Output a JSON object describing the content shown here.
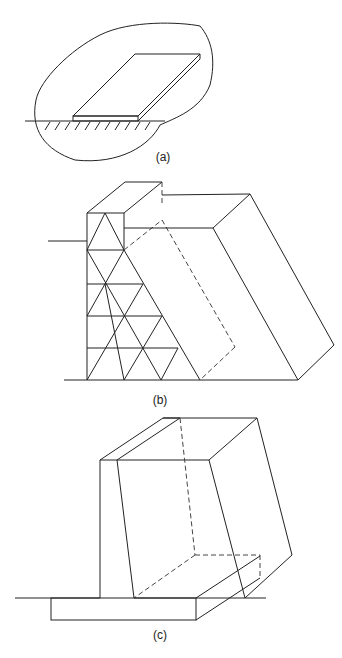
{
  "figure": {
    "panels": [
      {
        "id": "a",
        "caption": "(a)",
        "description": "Concrete slab resting on ground with outline boundary"
      },
      {
        "id": "b",
        "caption": "(b)",
        "description": "Triangulated lattice retaining structure with soil wedge"
      },
      {
        "id": "c",
        "caption": "(c)",
        "description": "Cantilever retaining wall with base slab and soil wedge"
      }
    ]
  }
}
